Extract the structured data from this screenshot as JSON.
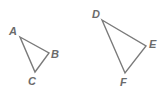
{
  "diagram": {
    "triangles": [
      {
        "name": "ABC",
        "vertices": [
          {
            "label": "A",
            "x": 20,
            "y": 37,
            "lx": 9,
            "ly": 35
          },
          {
            "label": "B",
            "x": 49,
            "y": 53,
            "lx": 51,
            "ly": 58
          },
          {
            "label": "C",
            "x": 35,
            "y": 72,
            "lx": 28,
            "ly": 85
          }
        ]
      },
      {
        "name": "DEF",
        "vertices": [
          {
            "label": "D",
            "x": 102,
            "y": 20,
            "lx": 92,
            "ly": 18
          },
          {
            "label": "E",
            "x": 146,
            "y": 46,
            "lx": 149,
            "ly": 48
          },
          {
            "label": "F",
            "x": 125,
            "y": 73,
            "lx": 120,
            "ly": 86
          }
        ]
      }
    ],
    "colors": {
      "stroke": "#7a7a7a",
      "label": "#6b6b6b",
      "background": "#ffffff"
    }
  }
}
